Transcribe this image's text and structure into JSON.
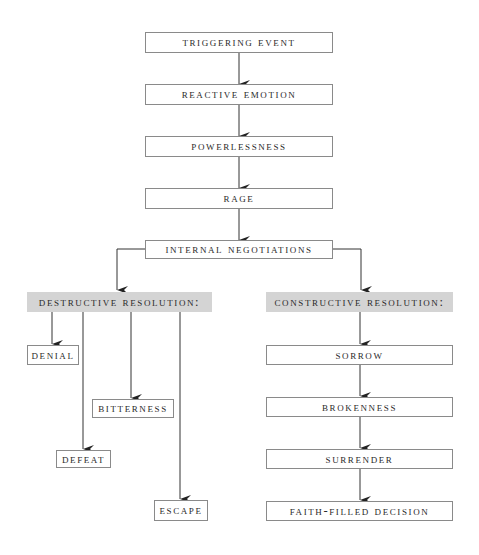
{
  "diagram": {
    "main_chain": [
      {
        "id": "triggering-event",
        "label": "Triggering Event"
      },
      {
        "id": "reactive-emotion",
        "label": "Reactive Emotion"
      },
      {
        "id": "powerlessness",
        "label": "Powerlessness"
      },
      {
        "id": "rage",
        "label": "Rage"
      },
      {
        "id": "internal-negotiations",
        "label": "Internal Negotiations"
      }
    ],
    "destructive": {
      "header": "Destructive Resolution:",
      "outcomes": [
        {
          "id": "denial",
          "label": "Denial"
        },
        {
          "id": "bitterness",
          "label": "Bitterness"
        },
        {
          "id": "defeat",
          "label": "Defeat"
        },
        {
          "id": "escape",
          "label": "Escape"
        }
      ]
    },
    "constructive": {
      "header": "Constructive Resolution:",
      "steps": [
        {
          "id": "sorrow",
          "label": "Sorrow"
        },
        {
          "id": "brokenness",
          "label": "Brokenness"
        },
        {
          "id": "surrender",
          "label": "Surrender"
        },
        {
          "id": "faith-filled-decision",
          "label": "Faith-Filled Decision"
        }
      ]
    },
    "colors": {
      "border": "#8a8a8a",
      "header_fill": "#d4d4d4",
      "arrow": "#333333"
    }
  }
}
